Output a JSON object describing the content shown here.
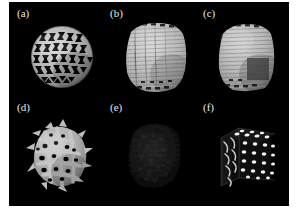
{
  "figure": {
    "background_color": "#000000",
    "page_background": "#ffffff",
    "label_color": "#e8e8e8",
    "columns": 3,
    "rows": 2,
    "panels": [
      {
        "id": "a",
        "label": "(a)",
        "label_x": 17,
        "label_y": 8,
        "shape": "sphere",
        "structure": "triangular-lattice-sphere",
        "description": "Sphere rendered as a bright grey open lattice with rows of dark triangular voids",
        "brightness": "bright",
        "render_color": "#b9b9b9",
        "void_color": "#0a0a0a",
        "center_x": 59,
        "center_y": 54,
        "size": 62
      },
      {
        "id": "b",
        "label": "(b)",
        "label_x": 110,
        "label_y": 8,
        "shape": "rounded-cube",
        "structure": "dense-fibrous-volume",
        "description": "Rounded cube filled with dense horizontal fibre texture, nearly solid grey",
        "brightness": "bright",
        "render_color": "#c2c2c2",
        "void_color": "#141414",
        "center_x": 145,
        "center_y": 55,
        "size": 70
      },
      {
        "id": "c",
        "label": "(c)",
        "label_x": 203,
        "label_y": 8,
        "shape": "rounded-cube",
        "structure": "fibrous-volume-with-dark-core",
        "description": "Rounded cube of grey fibres with a darker rectangular patch on the lower right face",
        "brightness": "bright",
        "render_color": "#bdbdbd",
        "void_color": "#111111",
        "center_x": 233,
        "center_y": 55,
        "size": 70
      },
      {
        "id": "d",
        "label": "(d)",
        "label_x": 17,
        "label_y": 102,
        "shape": "blob",
        "structure": "spiky-porous-network",
        "description": "Irregular rounded blob of thick grey struts with protruding spikes and round pores",
        "brightness": "bright",
        "render_color": "#b5b5b5",
        "void_color": "#0a0a0a",
        "center_x": 58,
        "center_y": 150,
        "size": 66
      },
      {
        "id": "e",
        "label": "(e)",
        "label_x": 110,
        "label_y": 102,
        "shape": "rounded-cube",
        "structure": "very-faint-noise-volume",
        "description": "Almost completely dark panel with barely visible faint speckled structure",
        "brightness": "very-dark",
        "render_color": "#2a2a2a",
        "void_color": "#000000",
        "center_x": 146,
        "center_y": 150,
        "size": 64
      },
      {
        "id": "f",
        "label": "(f)",
        "label_x": 203,
        "label_y": 102,
        "shape": "cube",
        "structure": "bright-dot-lattice-cube",
        "description": "Dark cube whose faces carry a regular grid of small bright elliptical dots, with curved streaks on the left face",
        "brightness": "dark-with-highlights",
        "render_color": "#f2f2f2",
        "void_color": "#000000",
        "center_x": 237,
        "center_y": 155,
        "size": 72
      }
    ]
  }
}
